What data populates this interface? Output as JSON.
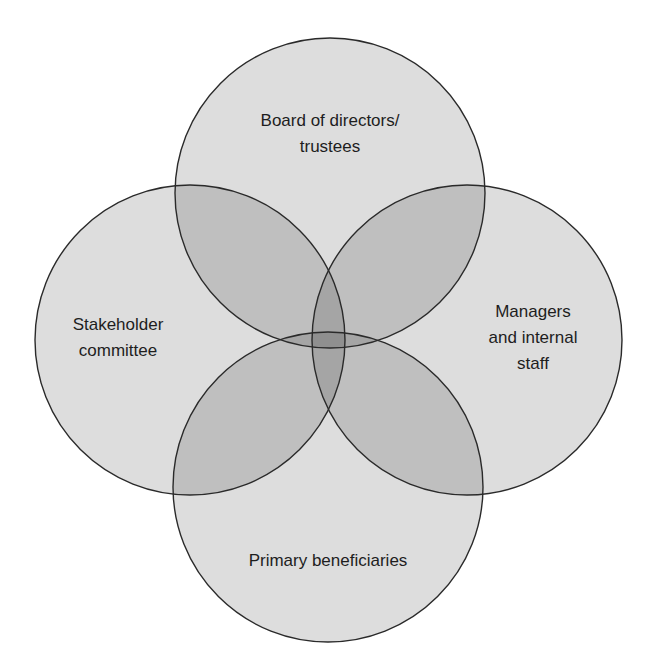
{
  "diagram": {
    "type": "venn",
    "colors": {
      "background": "#ffffff",
      "circle_fill": "#000000",
      "circle_fill_opacity": 0.135,
      "outline": "#2a2a2a",
      "text": "#1e1e1e"
    },
    "circles": [
      {
        "id": "board",
        "label_lines": [
          "Board of directors/",
          "trustees"
        ],
        "cx": 330,
        "cy": 193,
        "r": 155,
        "label_x": 330,
        "label_y": 108
      },
      {
        "id": "stakeholder",
        "label_lines": [
          "Stakeholder",
          "committee"
        ],
        "cx": 190,
        "cy": 340,
        "r": 155,
        "label_x": 118,
        "label_y": 312
      },
      {
        "id": "managers",
        "label_lines": [
          "Managers",
          "and internal",
          "staff"
        ],
        "cx": 467,
        "cy": 340,
        "r": 155,
        "label_x": 533,
        "label_y": 299
      },
      {
        "id": "beneficiaries",
        "label_lines": [
          "Primary beneficiaries"
        ],
        "cx": 328,
        "cy": 487,
        "r": 155,
        "label_x": 328,
        "label_y": 548
      }
    ]
  }
}
